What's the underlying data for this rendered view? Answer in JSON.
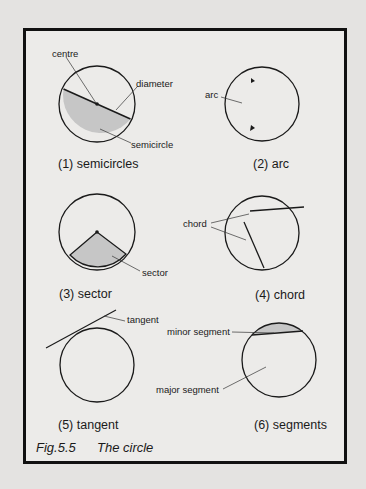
{
  "figure": {
    "label": "Fig.5.5",
    "title": "The circle"
  },
  "panels": [
    {
      "caption": "(1)  semicircles",
      "labels": {
        "centre": "centre",
        "diameter": "diameter",
        "semicircle": "semicircle"
      }
    },
    {
      "caption": "(2)  arc",
      "labels": {
        "arc": "arc"
      }
    },
    {
      "caption": "(3)  sector",
      "labels": {
        "sector": "sector"
      }
    },
    {
      "caption": "(4)  chord",
      "labels": {
        "chord": "chord"
      }
    },
    {
      "caption": "(5)  tangent",
      "labels": {
        "tangent": "tangent"
      }
    },
    {
      "caption": "(6)  segments",
      "labels": {
        "minor_segment": "minor segment",
        "major_segment": "major segment"
      }
    }
  ],
  "colors": {
    "shade": "#c6c6c6",
    "stroke": "#1a1a1a",
    "frame": "#111111"
  }
}
